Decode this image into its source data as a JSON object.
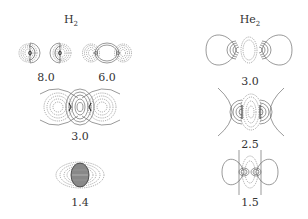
{
  "figure": {
    "columns": [
      {
        "title": "H",
        "subscript": "2",
        "panels": [
          {
            "label": "8.0"
          },
          {
            "label": "6.0"
          },
          {
            "label": "3.0"
          },
          {
            "label": "1.4"
          }
        ]
      },
      {
        "title": "He",
        "subscript": "2",
        "panels": [
          {
            "label": "3.0"
          },
          {
            "label": "2.5"
          },
          {
            "label": "1.5"
          }
        ]
      }
    ],
    "colors": {
      "line": "#555555",
      "background": "#ffffff"
    }
  }
}
